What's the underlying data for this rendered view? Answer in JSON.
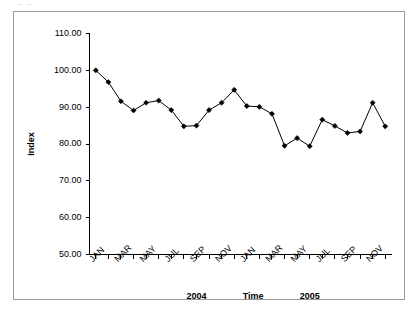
{
  "artifact": {
    "text": "~ ~"
  },
  "chart_data": {
    "type": "line",
    "title": "",
    "xlabel": "Time",
    "ylabel": "Index",
    "ylim": [
      50.0,
      110.0
    ],
    "ytick_step": 10.0,
    "ytick_labels": [
      "110.00",
      "100.00",
      "90.00",
      "80.00",
      "70.00",
      "60.00",
      "50.00"
    ],
    "ytick_values": [
      110.0,
      100.0,
      90.0,
      80.0,
      70.0,
      60.0,
      50.0
    ],
    "grid": false,
    "legend": "none",
    "marker": "filled-diamond",
    "x": [
      "JAN",
      "FEB",
      "MAR",
      "APR",
      "MAY",
      "JUN",
      "JUL",
      "AUG",
      "SEP",
      "OCT",
      "NOV",
      "DEC",
      "JAN",
      "FEB",
      "MAR",
      "APR",
      "MAY",
      "JUN",
      "JUL",
      "AUG",
      "SEP",
      "OCT",
      "NOV",
      "DEC"
    ],
    "xtick_labels": [
      "JAN",
      "",
      "MAR",
      "",
      "MAY",
      "",
      "JUL",
      "",
      "SEP",
      "",
      "NOV",
      "",
      "JAN",
      "",
      "MAR",
      "",
      "MAY",
      "",
      "JUL",
      "",
      "SEP",
      "",
      "NOV",
      ""
    ],
    "values": [
      100.0,
      96.8,
      91.6,
      89.1,
      91.2,
      91.8,
      89.2,
      84.8,
      85.0,
      89.2,
      91.2,
      94.7,
      90.3,
      90.1,
      88.2,
      79.5,
      81.6,
      79.4,
      86.6,
      84.9,
      83.0,
      83.4,
      91.2,
      84.8
    ],
    "group_labels": [
      {
        "text": "2004",
        "center_index": 8
      },
      {
        "text": "2005",
        "center_index": 17
      }
    ]
  }
}
